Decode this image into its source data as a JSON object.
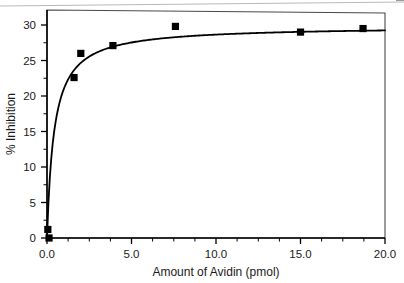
{
  "chart_data": {
    "type": "scatter",
    "title": "",
    "subtitle": "",
    "xlabel": "Amount of Avidin (pmol)",
    "ylabel": "% Inhibition",
    "xlim": [
      0.0,
      20.0
    ],
    "ylim": [
      0,
      31.5
    ],
    "xticks": [
      0.0,
      5.0,
      10.0,
      15.0,
      20.0
    ],
    "xtick_labels": [
      "0.0",
      "5.0",
      "10.0",
      "15.0",
      "20.0"
    ],
    "yticks": [
      0,
      5,
      10,
      15,
      20,
      25,
      30
    ],
    "ytick_labels": [
      "0",
      "5",
      "10",
      "15",
      "20",
      "25",
      "30"
    ],
    "x_minor_tick_interval": 1.25,
    "y_minor_tick_interval": 2.5,
    "grid": false,
    "legend": null,
    "marker": "filled-square",
    "marker_color": "#000000",
    "line_color": "#000000",
    "frame": true,
    "series": [
      {
        "name": "Avidin inhibition",
        "points": [
          {
            "x": 0.05,
            "y": 1.2
          },
          {
            "x": 0.12,
            "y": 0.0
          },
          {
            "x": 1.6,
            "y": 22.6
          },
          {
            "x": 2.0,
            "y": 26.0
          },
          {
            "x": 3.9,
            "y": 27.1
          },
          {
            "x": 7.6,
            "y": 29.8
          },
          {
            "x": 15.0,
            "y": 29.0
          },
          {
            "x": 18.7,
            "y": 29.5
          }
        ],
        "fit_curve": {
          "model": "saturation",
          "vmax": 29.85,
          "k": 0.42,
          "description": "rectangular-hyperbola fit through data, plateau near 29.8"
        }
      }
    ],
    "annotations": []
  },
  "artifacts": {
    "scan_line_label": "scan-edge-line"
  }
}
